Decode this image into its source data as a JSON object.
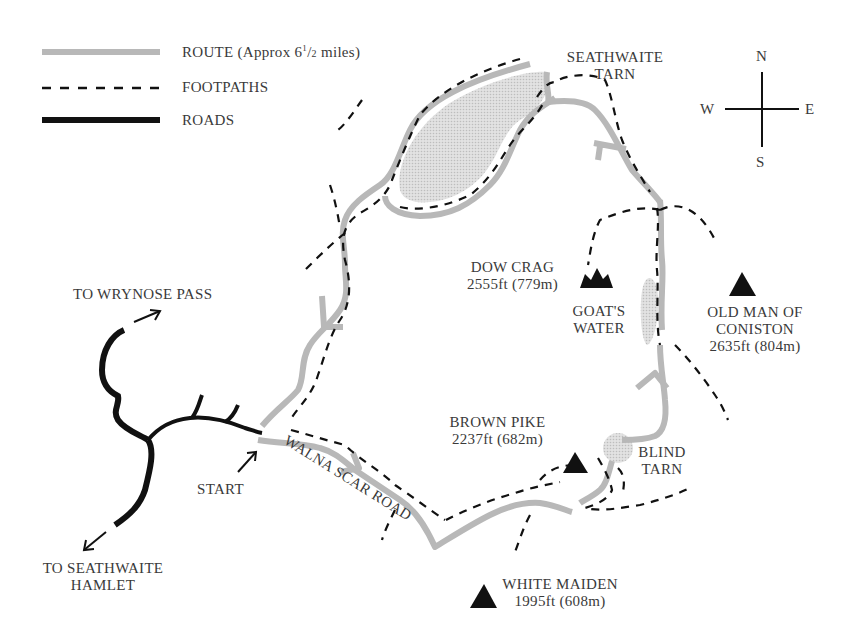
{
  "legend": {
    "route": {
      "label_main": "ROUTE (Approx 6",
      "sup": "1",
      "slash": "/",
      "sub": "2",
      "tail": " miles)",
      "color": "#b8b8b8"
    },
    "footpaths": {
      "label": "FOOTPATHS",
      "color": "#1a1a1a"
    },
    "roads": {
      "label": "ROADS",
      "color": "#111111"
    }
  },
  "compass": {
    "n": "N",
    "s": "S",
    "e": "E",
    "w": "W"
  },
  "places": {
    "seathwaite_tarn": {
      "line1": "SEATHWAITE",
      "line2": "TARN"
    },
    "dow_crag": {
      "name": "DOW CRAG",
      "height": "2555ft (779m)"
    },
    "goats_water": {
      "line1": "GOAT'S",
      "line2": "WATER"
    },
    "old_man": {
      "line1": "OLD MAN OF",
      "line2": "CONISTON",
      "height": "2635ft (804m)"
    },
    "brown_pike": {
      "name": "BROWN PIKE",
      "height": "2237ft (682m)"
    },
    "blind_tarn": {
      "line1": "BLIND",
      "line2": "TARN"
    },
    "white_maiden": {
      "name": "WHITE MAIDEN",
      "height": "1995ft (608m)"
    },
    "wrynose": {
      "label": "TO WRYNOSE PASS"
    },
    "seathwaite_hamlet": {
      "line1": "TO SEATHWAITE",
      "line2": "HAMLET"
    },
    "start": {
      "label": "START"
    },
    "walna_scar_road": {
      "label": "WALNA SCAR ROAD"
    }
  },
  "colors": {
    "route": "#b8b8b8",
    "water": "#d4d4d4",
    "ink": "#111111",
    "text": "#3a3a3a"
  }
}
